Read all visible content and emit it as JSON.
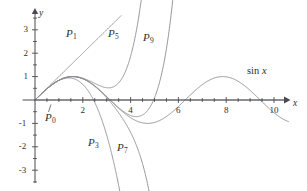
{
  "figure": {
    "name": "taylor-polynomials-of-sine",
    "width": 307,
    "height": 191,
    "background": "#ffffff",
    "curve_color": "#8a8a92",
    "axis_color": "#4a4a52",
    "text_color": "#2d2d33"
  },
  "axes": {
    "x_label": "x",
    "y_label": "y",
    "x_ticks": [
      {
        "value": 2,
        "label": "2"
      },
      {
        "value": 4,
        "label": "4"
      },
      {
        "value": 6,
        "label": "6"
      },
      {
        "value": 8,
        "label": "8"
      },
      {
        "value": 10,
        "label": "10"
      }
    ],
    "y_ticks": [
      {
        "value": 3,
        "label": "3"
      },
      {
        "value": 2,
        "label": "2"
      },
      {
        "value": 1,
        "label": "1"
      },
      {
        "value": -1,
        "label": "-1"
      },
      {
        "value": -2,
        "label": "-2"
      },
      {
        "value": -3,
        "label": "-3"
      }
    ],
    "x_minor_step": 0.5,
    "y_minor_step": 0.5,
    "xlim": [
      -0.55,
      10.9
    ],
    "ylim": [
      -3.85,
      3.6
    ],
    "grid": false
  },
  "annotations": [
    {
      "id": "P0",
      "text": "P",
      "sub": "0",
      "x": 45,
      "y": 112,
      "pointer": true
    },
    {
      "id": "P1",
      "text": "P",
      "sub": "1",
      "x": 66,
      "y": 28,
      "pointer": false
    },
    {
      "id": "P5",
      "text": "P",
      "sub": "5",
      "x": 108,
      "y": 28,
      "pointer": false
    },
    {
      "id": "P9",
      "text": "P",
      "sub": "9",
      "x": 143,
      "y": 32,
      "pointer": false
    },
    {
      "id": "P3",
      "text": "P",
      "sub": "3",
      "x": 88,
      "y": 137,
      "pointer": false
    },
    {
      "id": "P7",
      "text": "P",
      "sub": "7",
      "x": 117,
      "y": 142,
      "pointer": false
    },
    {
      "id": "sinx",
      "text": "sin x",
      "x": 247,
      "y": 66,
      "pointer": false
    }
  ],
  "chart_data": {
    "type": "line",
    "title": "",
    "xlabel": "x",
    "ylabel": "y",
    "xlim": [
      -0.55,
      10.9
    ],
    "ylim": [
      -3.85,
      3.6
    ],
    "grid": false,
    "legend": "inline-annotations",
    "x_ticks": [
      2,
      4,
      6,
      8,
      10
    ],
    "y_ticks": [
      3,
      2,
      1,
      -1,
      -2,
      -3
    ],
    "series": [
      {
        "name": "sin x",
        "label": "sin x",
        "kind": "function",
        "expression": "sin(x)",
        "terms": 0,
        "x_start": 0,
        "x_end": 10.6,
        "color": "#8a8a92",
        "key_points": [
          {
            "x": 0,
            "y": 0
          },
          {
            "x": 1.5708,
            "y": 1
          },
          {
            "x": 3.1416,
            "y": 0
          },
          {
            "x": 4.7124,
            "y": -1
          },
          {
            "x": 6.2832,
            "y": 0
          },
          {
            "x": 7.854,
            "y": 1
          },
          {
            "x": 9.4248,
            "y": 0
          }
        ]
      },
      {
        "name": "P0",
        "label": "P0",
        "kind": "taylor",
        "degree": 0,
        "expression": "0",
        "coefficients": [
          0
        ],
        "color": "#8a8a92",
        "x_start": 0,
        "x_end": 10.6
      },
      {
        "name": "P1",
        "label": "P1",
        "kind": "taylor",
        "degree": 1,
        "expression": "x",
        "coefficients": [
          0,
          1
        ],
        "color": "#8a8a92",
        "x_start": 0,
        "x_end": 3.6
      },
      {
        "name": "P3",
        "label": "P3",
        "kind": "taylor",
        "degree": 3,
        "expression": "x - x^3/6",
        "coefficients": [
          0,
          1,
          0,
          -0.1666666667
        ],
        "color": "#8a8a92",
        "x_start": 0,
        "x_end": 3.9
      },
      {
        "name": "P5",
        "label": "P5",
        "kind": "taylor",
        "degree": 5,
        "expression": "x - x^3/6 + x^5/120",
        "coefficients": [
          0,
          1,
          0,
          -0.1666666667,
          0,
          0.0083333333
        ],
        "color": "#8a8a92",
        "x_start": 0,
        "x_end": 5.1
      },
      {
        "name": "P7",
        "label": "P7",
        "kind": "taylor",
        "degree": 7,
        "expression": "x - x^3/6 + x^5/120 - x^7/5040",
        "coefficients": [
          0,
          1,
          0,
          -0.1666666667,
          0,
          0.0083333333,
          0,
          -0.0001984127
        ],
        "color": "#8a8a92",
        "x_start": 0,
        "x_end": 5.9
      },
      {
        "name": "P9",
        "label": "P9",
        "kind": "taylor",
        "degree": 9,
        "expression": "x - x^3/6 + x^5/120 - x^7/5040 + x^9/362880",
        "coefficients": [
          0,
          1,
          0,
          -0.1666666667,
          0,
          0.0083333333,
          0,
          -0.0001984127,
          0,
          2.7557e-06
        ],
        "color": "#8a8a92",
        "x_start": 0,
        "x_end": 7.2
      }
    ]
  }
}
